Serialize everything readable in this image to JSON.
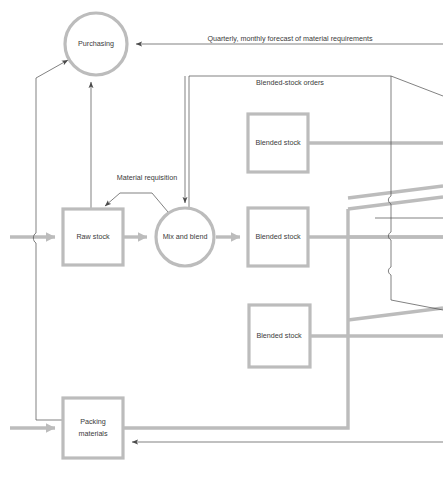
{
  "diagram": {
    "background_color": "#ffffff",
    "thick_flow_color": "#bcbcbc",
    "thin_flow_color": "#4a4a4a",
    "label_color": "#3a3a3a",
    "nodes": [
      {
        "id": "purchasing",
        "label": "Purchasing",
        "shape": "circle"
      },
      {
        "id": "raw-stock",
        "label": "Raw stock",
        "shape": "rect"
      },
      {
        "id": "mix-and-blend",
        "label": "Mix and blend",
        "shape": "circle"
      },
      {
        "id": "blended-stock-1",
        "label": "Blended stock",
        "shape": "rect"
      },
      {
        "id": "blended-stock-2",
        "label": "Blended stock",
        "shape": "rect"
      },
      {
        "id": "blended-stock-3",
        "label": "Blended stock",
        "shape": "rect"
      },
      {
        "id": "packing-materials",
        "label": "Packing\nmaterials",
        "shape": "rect",
        "label_line_1": "Packing",
        "label_line_2": "materials"
      }
    ],
    "flow_labels": [
      {
        "id": "forecast-label",
        "text": "Quarterly, monthly forecast of material requirements"
      },
      {
        "id": "blended-stock-orders-label",
        "text": "Blended-stock orders"
      },
      {
        "id": "material-requisition-label",
        "text": "Material requisition"
      }
    ],
    "caption": ""
  }
}
